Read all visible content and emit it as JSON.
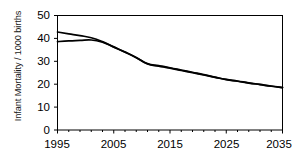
{
  "chart_data": {
    "type": "line",
    "title": "",
    "xlabel": "",
    "ylabel": "Infant Mortality / 1000 births",
    "xlim": [
      1995,
      2035
    ],
    "ylim": [
      0,
      50
    ],
    "grid": false,
    "legend_position": "inline-annotation",
    "x_ticks": [
      "1995",
      "2005",
      "2015",
      "2025",
      "2035"
    ],
    "x_tick_values": [
      1995,
      2005,
      2015,
      2025,
      2035
    ],
    "x_minor_tick_values": [
      1997,
      1999,
      2001,
      2003,
      2007,
      2009,
      2011,
      2013,
      2017,
      2019,
      2021,
      2023,
      2027,
      2029,
      2031,
      2033
    ],
    "y_ticks": [
      "0",
      "10",
      "20",
      "30",
      "40",
      "50"
    ],
    "y_tick_values": [
      0,
      10,
      20,
      30,
      40,
      50
    ],
    "line_color": "#000000",
    "frame_color": "#000000",
    "annotations": [
      {
        "label": "μ",
        "name": "mu",
        "x": 2007,
        "y": 44.0
      },
      {
        "label": "σ",
        "name": "sigma",
        "x": 1999,
        "y": 31.5
      }
    ],
    "x": [
      1995,
      1997,
      1999,
      2001,
      2003,
      2005,
      2007,
      2009,
      2011,
      2013,
      2015,
      2017,
      2019,
      2021,
      2023,
      2025,
      2027,
      2029,
      2031,
      2033,
      2035
    ],
    "series": [
      {
        "name": "μ",
        "label": "mu",
        "values": [
          42.8,
          42.0,
          41.2,
          40.3,
          38.6,
          36.3,
          34.0,
          31.6,
          29.0,
          28.1,
          27.2,
          26.2,
          25.2,
          24.2,
          23.1,
          22.1,
          21.4,
          20.6,
          19.9,
          19.2,
          18.6
        ]
      },
      {
        "name": "σ",
        "label": "sigma",
        "values": [
          38.6,
          38.9,
          39.1,
          39.3,
          38.3,
          36.2,
          34.1,
          31.7,
          28.8,
          27.9,
          27.0,
          26.0,
          25.0,
          24.0,
          23.0,
          22.0,
          21.3,
          20.5,
          19.8,
          19.1,
          18.5
        ]
      }
    ]
  }
}
